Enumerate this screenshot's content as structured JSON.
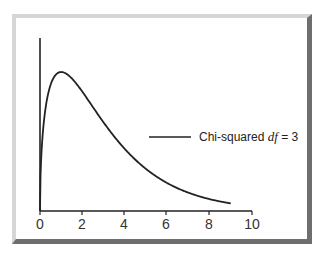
{
  "chart_data": {
    "type": "line",
    "title": "",
    "xlabel": "",
    "ylabel": "",
    "xlim": [
      0,
      10
    ],
    "x_ticks": [
      0,
      2,
      4,
      6,
      8,
      10
    ],
    "x_tick_labels": [
      "0",
      "2",
      "4",
      "6",
      "8",
      "10"
    ],
    "grid": false,
    "legend_position": "right-center",
    "series": [
      {
        "name": "Chi-squared df = 3",
        "distribution": "chi-squared",
        "df": 3,
        "x": [
          0,
          0.25,
          0.5,
          0.75,
          1.0,
          1.5,
          2.0,
          2.5,
          3.0,
          3.5,
          4.0,
          5.0,
          6.0,
          7.0,
          8.0,
          9.0
        ],
        "y": [
          0,
          0.176,
          0.2197,
          0.2357,
          0.242,
          0.2313,
          0.2076,
          0.1783,
          0.1542,
          0.1296,
          0.108,
          0.0732,
          0.0489,
          0.0317,
          0.0206,
          0.0133
        ],
        "color": "#222222"
      }
    ]
  },
  "legend": {
    "prefix": "Chi-squared ",
    "italic": "df",
    "suffix": " = 3"
  },
  "axis": {
    "x_tick_labels": [
      "0",
      "2",
      "4",
      "6",
      "8",
      "10"
    ]
  }
}
